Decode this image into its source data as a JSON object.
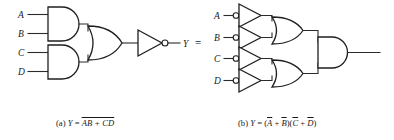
{
  "figure": {
    "background": "#ffffff",
    "ink": "#1f1f1f",
    "equals_sign": "=",
    "panels": [
      {
        "id": "a",
        "caption_prefix": "(a)",
        "caption_var": "Y",
        "caption_eq": "=",
        "caption_expr_overbar": "AB + CD",
        "caption_plain": "(a) Y = ̅A̅B̅ ̅+̅ ̅C̅D̅",
        "output_label": "Y",
        "inputs": [
          {
            "label": "A"
          },
          {
            "label": "B"
          },
          {
            "label": "C"
          },
          {
            "label": "D"
          }
        ],
        "gates": [
          {
            "name": "and-gate-ab",
            "type": "AND",
            "inputs": [
              "A",
              "B"
            ]
          },
          {
            "name": "and-gate-cd",
            "type": "AND",
            "inputs": [
              "C",
              "D"
            ]
          },
          {
            "name": "or-gate",
            "type": "OR",
            "inputs": [
              "AB",
              "CD"
            ]
          },
          {
            "name": "inverter",
            "type": "NOT",
            "inputs": [
              "AB + CD"
            ],
            "bubble_side": "output"
          }
        ]
      },
      {
        "id": "b",
        "caption_prefix": "(b)",
        "caption_var": "Y",
        "caption_eq": "=",
        "caption_open": "(",
        "caption_t1": "A",
        "caption_plus": "+",
        "caption_t2": "B",
        "caption_mid": ")(",
        "caption_t3": "C",
        "caption_plus2": "+",
        "caption_t4": "D",
        "caption_close": ")",
        "caption_plain": "(b) Y = (A̅ + B̅)(C̅ + D̅)",
        "output_label": "",
        "inputs": [
          {
            "label": "A"
          },
          {
            "label": "B"
          },
          {
            "label": "C"
          },
          {
            "label": "D"
          }
        ],
        "gates": [
          {
            "name": "inverter-a",
            "type": "NOT",
            "inputs": [
              "A"
            ],
            "bubble_side": "input"
          },
          {
            "name": "inverter-b",
            "type": "NOT",
            "inputs": [
              "B"
            ],
            "bubble_side": "input"
          },
          {
            "name": "inverter-c",
            "type": "NOT",
            "inputs": [
              "C"
            ],
            "bubble_side": "input"
          },
          {
            "name": "inverter-d",
            "type": "NOT",
            "inputs": [
              "D"
            ],
            "bubble_side": "input"
          },
          {
            "name": "or-gate-top",
            "type": "OR",
            "inputs": [
              "notA",
              "notB"
            ]
          },
          {
            "name": "or-gate-bottom",
            "type": "OR",
            "inputs": [
              "notC",
              "notD"
            ]
          },
          {
            "name": "and-gate-out",
            "type": "AND",
            "inputs": [
              "or-top",
              "or-bottom"
            ]
          }
        ]
      }
    ]
  }
}
